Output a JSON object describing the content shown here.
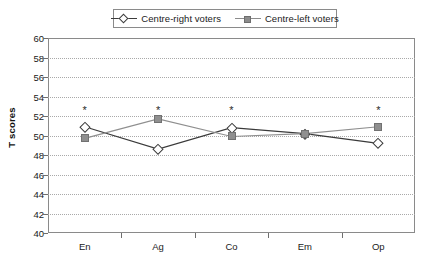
{
  "chart_data": {
    "type": "line",
    "title": "",
    "xlabel": "",
    "ylabel": "T scores",
    "categories": [
      "En",
      "Ag",
      "Co",
      "Em",
      "Op"
    ],
    "ylim": [
      40,
      60
    ],
    "yticks": [
      40,
      42,
      44,
      46,
      48,
      50,
      52,
      54,
      56,
      58,
      60
    ],
    "grid": true,
    "legend_position": "top-center",
    "series": [
      {
        "name": "Centre-right voters",
        "marker": "open-diamond",
        "color": "#3a3a3a",
        "values": [
          50.9,
          48.6,
          50.8,
          50.2,
          49.2
        ]
      },
      {
        "name": "Centre-left voters",
        "marker": "filled-square",
        "color": "#8f8f8f",
        "values": [
          49.7,
          51.7,
          49.9,
          50.2,
          50.9
        ]
      }
    ],
    "annotations": [
      {
        "category": "En",
        "text": "*",
        "y": 52.6
      },
      {
        "category": "Ag",
        "text": "*",
        "y": 52.6
      },
      {
        "category": "Co",
        "text": "*",
        "y": 52.6
      },
      {
        "category": "Op",
        "text": "*",
        "y": 52.6
      }
    ]
  },
  "legend": {
    "entries": [
      {
        "label": "Centre-right voters",
        "key": "open-diamond-line"
      },
      {
        "label": "Centre-left voters",
        "key": "filled-square-line"
      }
    ]
  },
  "axes": {
    "y_title": "T scores"
  }
}
